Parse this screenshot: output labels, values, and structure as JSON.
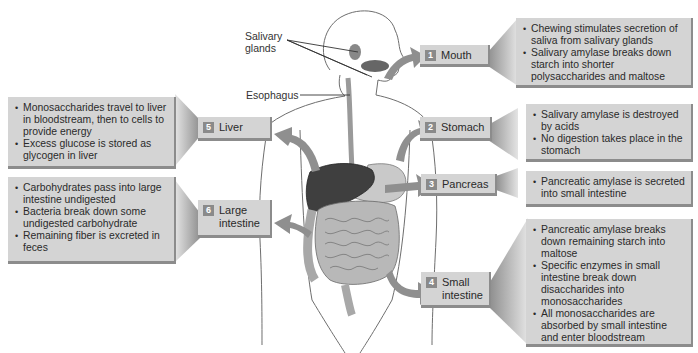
{
  "figure": {
    "annotations": {
      "salivary_glands": "Salivary\nglands",
      "salivary_glands_line1": "Salivary",
      "salivary_glands_line2": "glands",
      "esophagus": "Esophagus"
    },
    "organs": [
      {
        "number": "1",
        "name": "Mouth",
        "name_lines": [
          "Mouth"
        ],
        "side": "right",
        "facts": [
          "Chewing stimulates secretion of saliva from salivary glands",
          "Salivary amylase breaks down starch into shorter polysaccharides and maltose"
        ]
      },
      {
        "number": "2",
        "name": "Stomach",
        "name_lines": [
          "Stomach"
        ],
        "side": "right",
        "facts": [
          "Salivary amylase is destroyed by acids",
          "No digestion takes place in the stomach"
        ]
      },
      {
        "number": "3",
        "name": "Pancreas",
        "name_lines": [
          "Pancreas"
        ],
        "side": "right",
        "facts": [
          "Pancreatic amylase is secreted into small intestine"
        ]
      },
      {
        "number": "4",
        "name": "Small intestine",
        "name_lines": [
          "Small",
          "intestine"
        ],
        "side": "right",
        "facts": [
          "Pancreatic amylase breaks down remaining starch into maltose",
          "Specific enzymes in small intestine break down disaccharides into monosaccharides",
          "All monosaccharides are absorbed by small intestine and enter bloodstream"
        ]
      },
      {
        "number": "5",
        "name": "Liver",
        "name_lines": [
          "Liver"
        ],
        "side": "left",
        "facts": [
          "Monosaccharides travel to liver in bloodstream, then to cells to provide energy",
          "Excess glucose is stored as glycogen in liver"
        ]
      },
      {
        "number": "6",
        "name": "Large intestine",
        "name_lines": [
          "Large",
          "intestine"
        ],
        "side": "left",
        "facts": [
          "Carbohydrates pass into large intestine undigested",
          "Bacteria break down some undigested carbohydrate",
          "Remaining fiber is excreted in feces"
        ]
      }
    ],
    "colors": {
      "box_fill": "#d4d4d4",
      "box_shadow": "#8c8c8c",
      "badge": "#8a8a8a",
      "arrow": "#8f8f8f",
      "liver": "#3f3f3f",
      "intestine": "#b8b8b8"
    }
  }
}
